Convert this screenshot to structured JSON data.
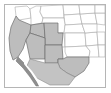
{
  "figure": {
    "kind": "thumbnail-map",
    "title": "Southwestern United States highlighted region map",
    "frame_color": "#b5b5b5",
    "background_color": "#ffffff",
    "highlight_fill": "#bdbdbd",
    "highlight_stroke": "#6e6e6e",
    "plain_fill": "#ffffff",
    "plain_stroke": "#a9a9a9",
    "peninsula_fill": "#8f8f8f"
  },
  "map_data": {
    "projection_extent": "western North America",
    "highlighted_states": [
      {
        "name": "California",
        "code": "CA",
        "highlighted": true
      },
      {
        "name": "Nevada",
        "code": "NV",
        "highlighted": true
      },
      {
        "name": "Utah",
        "code": "UT",
        "highlighted": true
      },
      {
        "name": "Arizona",
        "code": "AZ",
        "highlighted": true
      },
      {
        "name": "New Mexico",
        "code": "NM",
        "highlighted": true
      },
      {
        "name": "Texas (west)",
        "code": "TX",
        "highlighted": true
      }
    ],
    "plain_states": [
      {
        "name": "Oregon",
        "code": "OR",
        "highlighted": false
      },
      {
        "name": "Idaho",
        "code": "ID",
        "highlighted": false
      },
      {
        "name": "Montana",
        "code": "MT",
        "highlighted": false
      },
      {
        "name": "Wyoming",
        "code": "WY",
        "highlighted": false
      },
      {
        "name": "Colorado",
        "code": "CO",
        "highlighted": false
      },
      {
        "name": "Nebraska",
        "code": "NE",
        "highlighted": false
      },
      {
        "name": "Kansas",
        "code": "KS",
        "highlighted": false
      },
      {
        "name": "Oklahoma",
        "code": "OK",
        "highlighted": false
      },
      {
        "name": "North Dakota",
        "code": "ND",
        "highlighted": false
      },
      {
        "name": "South Dakota",
        "code": "SD",
        "highlighted": false
      }
    ],
    "highlighted_regions_mexico": [
      {
        "name": "Baja California",
        "highlighted": true
      },
      {
        "name": "Sonora",
        "highlighted": true
      },
      {
        "name": "Chihuahua",
        "highlighted": true
      }
    ],
    "water_bodies": [
      {
        "name": "Pacific Ocean"
      },
      {
        "name": "Gulf of California"
      }
    ],
    "labels": []
  }
}
